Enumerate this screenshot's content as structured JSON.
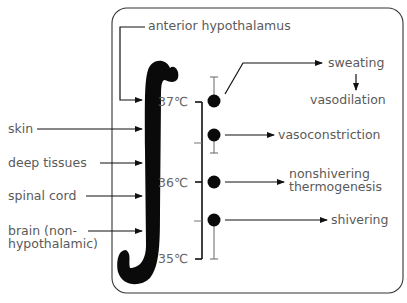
{
  "diagram": {
    "integrator": {
      "label": "anterior hypothalamus",
      "symbol": "integral"
    },
    "inputs": [
      {
        "label": "skin"
      },
      {
        "label": "deep tissues"
      },
      {
        "label": "spinal cord"
      },
      {
        "label_line1": "brain (non-",
        "label_line2": "hypothalamic)"
      }
    ],
    "temperature_scale": {
      "ticks": [
        "37℃",
        "36℃",
        "35℃"
      ]
    },
    "responses": [
      {
        "label": "sweating",
        "threshold": "~37℃ (high)"
      },
      {
        "label": "vasodilation",
        "note": "follows sweating"
      },
      {
        "label": "vasoconstriction",
        "threshold": "~36.7℃"
      },
      {
        "label_line1": "nonshivering",
        "label_line2": "thermogenesis",
        "threshold": "~36℃"
      },
      {
        "label": "shivering",
        "threshold": "~35.5℃"
      }
    ]
  }
}
